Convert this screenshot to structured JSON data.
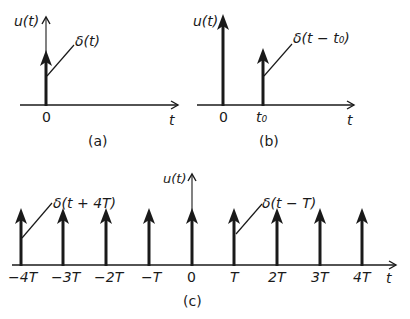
{
  "panels": {
    "a": {
      "caption": "(a)",
      "y_axis_label": "u(t)",
      "x_axis_label": "t",
      "ticks": [
        "0"
      ],
      "impulse_label": "δ(t)"
    },
    "b": {
      "caption": "(b)",
      "y_axis_label": "u(t)",
      "x_axis_label": "t",
      "ticks": [
        "0",
        "t₀"
      ],
      "impulse_label": "δ(t − t₀)"
    },
    "c": {
      "caption": "(c)",
      "y_axis_label": "u(t)",
      "x_axis_label": "t",
      "ticks": [
        "−4T",
        "−3T",
        "−2T",
        "−T",
        "0",
        "T",
        "2T",
        "3T",
        "4T"
      ],
      "impulse_labels": [
        "δ(t + 4T)",
        "δ(t − T)"
      ]
    }
  },
  "colors": {
    "ink": "#1a1a1a",
    "background": "#ffffff"
  }
}
